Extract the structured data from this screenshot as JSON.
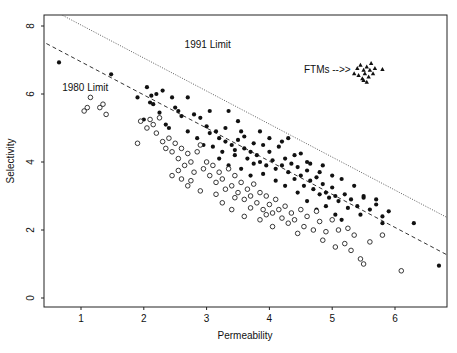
{
  "chart_data": {
    "type": "scatter",
    "title": "",
    "xlabel": "Permeability",
    "ylabel": "Selectivity",
    "xlim": [
      0.35,
      6.95
    ],
    "ylim": [
      -0.25,
      8.4
    ],
    "xticks": [
      1,
      2,
      3,
      4,
      5,
      6
    ],
    "yticks": [
      0,
      2,
      4,
      6,
      8
    ],
    "grid": false,
    "legend": null,
    "annotations": [
      {
        "text": "1991 Limit",
        "x": 2.65,
        "y": 7.35
      },
      {
        "text": "1980 Limit",
        "x": 0.7,
        "y": 6.1
      },
      {
        "text": "FTMs -->>",
        "x": 4.55,
        "y": 6.62
      }
    ],
    "lines": [
      {
        "name": "1991 Limit",
        "style": "dotted",
        "x": [
          0.67,
          6.95
        ],
        "y": [
          8.35,
          2.25
        ]
      },
      {
        "name": "1980 Limit",
        "style": "dashed",
        "x": [
          0.35,
          6.95
        ],
        "y": [
          7.58,
          1.15
        ]
      }
    ],
    "series": [
      {
        "name": "filled-circles",
        "marker": "filled-circle",
        "points": [
          [
            0.65,
            6.93
          ],
          [
            1.48,
            6.58
          ],
          [
            1.9,
            5.9
          ],
          [
            2.05,
            6.2
          ],
          [
            2.1,
            5.75
          ],
          [
            2.12,
            5.95
          ],
          [
            2.15,
            5.7
          ],
          [
            2.3,
            6.1
          ],
          [
            2.2,
            6.0
          ],
          [
            2.5,
            5.6
          ],
          [
            2.45,
            5.9
          ],
          [
            2.55,
            5.5
          ],
          [
            2.6,
            5.35
          ],
          [
            2.35,
            5.1
          ],
          [
            2.25,
            5.45
          ],
          [
            2.4,
            5.0
          ],
          [
            2.7,
            4.9
          ],
          [
            2.8,
            5.4
          ],
          [
            2.9,
            5.3
          ],
          [
            3.0,
            5.05
          ],
          [
            3.05,
            4.85
          ],
          [
            3.2,
            4.7
          ],
          [
            3.3,
            4.6
          ],
          [
            3.35,
            5.5
          ],
          [
            3.15,
            4.9
          ],
          [
            2.95,
            4.5
          ],
          [
            3.1,
            4.45
          ],
          [
            3.25,
            4.3
          ],
          [
            3.4,
            4.5
          ],
          [
            3.45,
            4.2
          ],
          [
            3.5,
            4.65
          ],
          [
            3.55,
            4.9
          ],
          [
            3.6,
            4.4
          ],
          [
            3.65,
            4.1
          ],
          [
            3.7,
            4.3
          ],
          [
            3.75,
            4.55
          ],
          [
            3.8,
            4.2
          ],
          [
            3.85,
            4.0
          ],
          [
            3.9,
            4.5
          ],
          [
            3.95,
            3.9
          ],
          [
            4.0,
            4.3
          ],
          [
            4.05,
            4.05
          ],
          [
            4.1,
            3.8
          ],
          [
            4.15,
            4.45
          ],
          [
            4.2,
            3.9
          ],
          [
            4.25,
            4.1
          ],
          [
            4.3,
            3.7
          ],
          [
            4.35,
            3.95
          ],
          [
            4.4,
            3.5
          ],
          [
            4.45,
            3.85
          ],
          [
            4.5,
            3.6
          ],
          [
            4.55,
            3.3
          ],
          [
            4.6,
            3.75
          ],
          [
            4.65,
            3.45
          ],
          [
            4.7,
            3.2
          ],
          [
            4.75,
            3.55
          ],
          [
            4.8,
            3.05
          ],
          [
            4.85,
            3.35
          ],
          [
            4.9,
            3.1
          ],
          [
            4.95,
            2.95
          ],
          [
            5.0,
            3.25
          ],
          [
            5.05,
            3.0
          ],
          [
            5.1,
            2.85
          ],
          [
            5.2,
            3.05
          ],
          [
            5.3,
            2.9
          ],
          [
            5.4,
            2.7
          ],
          [
            5.5,
            2.95
          ],
          [
            5.6,
            2.6
          ],
          [
            5.7,
            2.75
          ],
          [
            5.8,
            2.4
          ],
          [
            5.9,
            2.55
          ],
          [
            6.3,
            2.2
          ],
          [
            6.7,
            0.95
          ],
          [
            3.3,
            5.0
          ],
          [
            3.5,
            5.2
          ],
          [
            3.6,
            4.75
          ],
          [
            3.45,
            4.35
          ],
          [
            3.75,
            3.95
          ],
          [
            4.0,
            4.7
          ],
          [
            4.2,
            4.6
          ],
          [
            4.4,
            4.2
          ],
          [
            4.6,
            4.0
          ],
          [
            4.8,
            3.7
          ],
          [
            3.85,
            4.9
          ],
          [
            3.05,
            5.5
          ],
          [
            2.7,
            5.9
          ],
          [
            2.0,
            5.25
          ],
          [
            2.85,
            4.7
          ],
          [
            3.2,
            4.1
          ],
          [
            3.35,
            3.9
          ],
          [
            3.55,
            3.8
          ],
          [
            3.7,
            3.6
          ],
          [
            3.9,
            3.65
          ],
          [
            4.1,
            3.45
          ],
          [
            4.25,
            3.3
          ],
          [
            4.45,
            3.1
          ],
          [
            4.6,
            2.85
          ],
          [
            4.75,
            2.6
          ],
          [
            4.9,
            2.7
          ],
          [
            5.05,
            2.45
          ],
          [
            5.15,
            2.3
          ],
          [
            5.25,
            2.65
          ],
          [
            5.45,
            2.45
          ],
          [
            4.3,
            4.7
          ],
          [
            4.5,
            4.25
          ],
          [
            4.65,
            3.95
          ],
          [
            4.85,
            3.9
          ],
          [
            5.0,
            3.6
          ],
          [
            5.15,
            3.5
          ],
          [
            5.35,
            3.3
          ],
          [
            5.5,
            3.0
          ],
          [
            5.7,
            2.9
          ],
          [
            5.8,
            2.2
          ]
        ]
      },
      {
        "name": "open-circles",
        "marker": "open-circle",
        "points": [
          [
            1.05,
            5.5
          ],
          [
            1.1,
            5.6
          ],
          [
            1.15,
            5.9
          ],
          [
            1.3,
            5.6
          ],
          [
            1.35,
            5.7
          ],
          [
            1.4,
            5.4
          ],
          [
            1.9,
            4.55
          ],
          [
            1.95,
            5.2
          ],
          [
            2.05,
            5.0
          ],
          [
            2.1,
            5.25
          ],
          [
            2.15,
            5.1
          ],
          [
            2.2,
            4.85
          ],
          [
            2.25,
            5.3
          ],
          [
            2.3,
            4.6
          ],
          [
            2.35,
            4.4
          ],
          [
            2.4,
            4.7
          ],
          [
            2.45,
            4.3
          ],
          [
            2.5,
            4.55
          ],
          [
            2.55,
            4.1
          ],
          [
            2.6,
            4.4
          ],
          [
            2.65,
            3.9
          ],
          [
            2.7,
            4.25
          ],
          [
            2.75,
            4.0
          ],
          [
            2.8,
            3.7
          ],
          [
            2.85,
            4.3
          ],
          [
            2.9,
            4.5
          ],
          [
            2.95,
            3.8
          ],
          [
            3.0,
            4.0
          ],
          [
            3.05,
            3.6
          ],
          [
            3.1,
            3.9
          ],
          [
            3.15,
            3.4
          ],
          [
            3.2,
            3.7
          ],
          [
            3.25,
            3.5
          ],
          [
            3.3,
            3.2
          ],
          [
            3.35,
            3.8
          ],
          [
            3.4,
            3.3
          ],
          [
            3.45,
            3.6
          ],
          [
            3.5,
            3.1
          ],
          [
            3.55,
            3.4
          ],
          [
            3.6,
            2.9
          ],
          [
            3.65,
            3.2
          ],
          [
            3.7,
            3.0
          ],
          [
            3.75,
            3.35
          ],
          [
            3.8,
            2.8
          ],
          [
            3.85,
            3.1
          ],
          [
            3.9,
            2.6
          ],
          [
            3.95,
            3.0
          ],
          [
            4.0,
            2.75
          ],
          [
            4.05,
            2.5
          ],
          [
            4.1,
            2.9
          ],
          [
            4.15,
            2.6
          ],
          [
            4.2,
            2.35
          ],
          [
            4.25,
            2.7
          ],
          [
            4.3,
            2.2
          ],
          [
            4.35,
            2.5
          ],
          [
            4.4,
            2.3
          ],
          [
            4.5,
            2.6
          ],
          [
            4.55,
            2.1
          ],
          [
            4.6,
            2.4
          ],
          [
            4.7,
            2.0
          ],
          [
            4.8,
            2.25
          ],
          [
            4.9,
            1.95
          ],
          [
            5.0,
            2.3
          ],
          [
            5.1,
            2.0
          ],
          [
            5.2,
            1.6
          ],
          [
            5.35,
            1.85
          ],
          [
            5.45,
            1.15
          ],
          [
            5.5,
            1.0
          ],
          [
            5.6,
            1.65
          ],
          [
            5.8,
            1.85
          ],
          [
            6.1,
            0.8
          ],
          [
            2.6,
            3.5
          ],
          [
            2.7,
            3.3
          ],
          [
            2.45,
            3.6
          ],
          [
            2.55,
            3.75
          ],
          [
            3.4,
            2.6
          ],
          [
            3.6,
            2.4
          ],
          [
            3.85,
            2.3
          ],
          [
            4.05,
            2.1
          ],
          [
            3.25,
            2.8
          ],
          [
            3.45,
            2.95
          ],
          [
            2.9,
            3.15
          ],
          [
            2.75,
            3.45
          ],
          [
            3.15,
            3.05
          ],
          [
            3.7,
            2.65
          ],
          [
            4.45,
            1.9
          ],
          [
            4.85,
            1.7
          ],
          [
            5.05,
            1.5
          ],
          [
            5.25,
            2.05
          ],
          [
            3.95,
            2.45
          ],
          [
            4.75,
            2.55
          ],
          [
            5.3,
            1.4
          ]
        ]
      },
      {
        "name": "FTMs",
        "marker": "filled-triangle",
        "points": [
          [
            5.35,
            6.6
          ],
          [
            5.4,
            6.75
          ],
          [
            5.45,
            6.85
          ],
          [
            5.5,
            6.7
          ],
          [
            5.52,
            6.6
          ],
          [
            5.55,
            6.8
          ],
          [
            5.58,
            6.5
          ],
          [
            5.6,
            6.7
          ],
          [
            5.62,
            6.9
          ],
          [
            5.65,
            6.6
          ],
          [
            5.48,
            6.45
          ],
          [
            5.5,
            6.4
          ],
          [
            5.55,
            6.35
          ],
          [
            5.68,
            6.75
          ],
          [
            5.8,
            6.72
          ],
          [
            5.42,
            6.55
          ]
        ]
      }
    ]
  }
}
